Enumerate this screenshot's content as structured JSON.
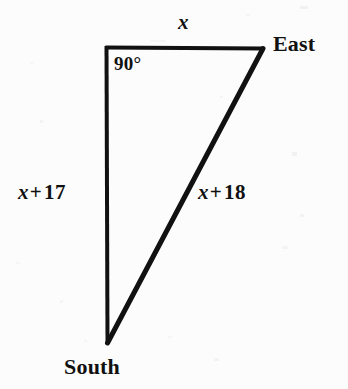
{
  "figure": {
    "kind": "right-triangle-diagram",
    "background_color": "#fcfcfc",
    "stroke_color": "#111111",
    "vertices": {
      "corner": {
        "name": "right-angle-corner",
        "x": 106,
        "y": 47
      },
      "east": {
        "name": "east-vertex",
        "x": 263,
        "y": 48
      },
      "south": {
        "name": "south-vertex",
        "x": 107,
        "y": 343
      }
    },
    "labels": {
      "top_side": "x",
      "right_angle": "90°",
      "east_vertex": "East",
      "left_side": {
        "variable": "x",
        "operator": "+",
        "number": "17",
        "full": "x + 17"
      },
      "hypotenuse": {
        "variable": "x",
        "operator": "+",
        "number": "18",
        "full": "x + 18"
      },
      "south_vertex": "South"
    }
  }
}
